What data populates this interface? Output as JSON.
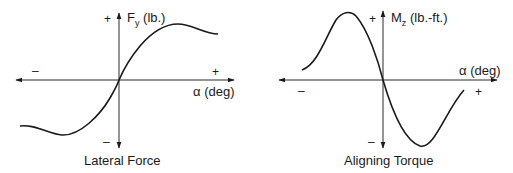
{
  "panels": [
    {
      "title": "Lateral Force",
      "y_axis_label_main": "F",
      "y_axis_label_sub": "y",
      "y_axis_label_unit": " (lb.)",
      "x_axis_label": "α (deg)",
      "x_plus": "+",
      "x_minus": "–",
      "y_plus": "+",
      "y_minus": "–"
    },
    {
      "title": "Aligning Torque",
      "y_axis_label_main": "M",
      "y_axis_label_sub": "z",
      "y_axis_label_unit": " (lb.-ft.)",
      "x_axis_label": "α (deg)",
      "x_plus": "+",
      "x_minus": "–",
      "y_plus": "+",
      "y_minus": "–"
    }
  ],
  "colors": {
    "line": "#1a1a1a",
    "background": "#ffffff"
  }
}
